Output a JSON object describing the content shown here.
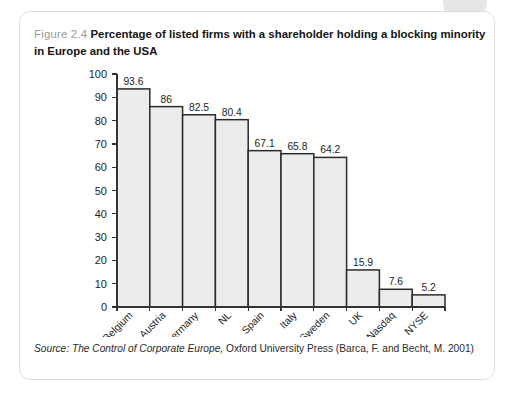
{
  "figure": {
    "number": "Figure 2.4",
    "caption": "Percentage of listed firms with a shareholder holding a blocking minority in Europe and the USA",
    "source_prefix": "Source:",
    "source_title": "The Control of Corporate Europe,",
    "source_rest": "Oxford University Press (Barca, F. and Becht, M. 2001)"
  },
  "colors": {
    "bar_fill": "#ececec",
    "bar_stroke": "#2b2b2b",
    "axis": "#333333",
    "caption_number": "#9a9a9a",
    "card_border": "#dcdcdc"
  },
  "chart_data": {
    "type": "bar",
    "title": "Percentage of listed firms with a shareholder holding a blocking minority in Europe and the USA",
    "xlabel": "",
    "ylabel": "",
    "ylim": [
      0,
      100
    ],
    "yticks": [
      0,
      10,
      20,
      30,
      40,
      50,
      60,
      70,
      80,
      90,
      100
    ],
    "grid": false,
    "legend": "none",
    "categories": [
      "Belgium",
      "Austria",
      "Germany",
      "NL",
      "Spain",
      "Italy",
      "Sweden",
      "UK",
      "Nasdaq",
      "NYSE"
    ],
    "values": [
      93.6,
      86,
      82.5,
      80.4,
      67.1,
      65.8,
      64.2,
      15.9,
      7.6,
      5.2
    ],
    "value_labels": [
      "93.6",
      "86",
      "82.5",
      "80.4",
      "67.1",
      "65.8",
      "64.2",
      "15.9",
      "7.6",
      "5.2"
    ]
  }
}
